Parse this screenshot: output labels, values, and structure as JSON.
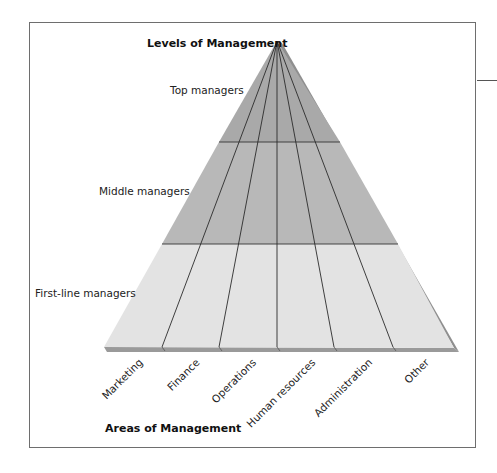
{
  "title": "Levels of Management",
  "axis_title": "Areas of Management",
  "levels": [
    {
      "label": "Top managers",
      "color": "#a9a9a9"
    },
    {
      "label": "Middle managers",
      "color": "#b9b9b9"
    },
    {
      "label": "First-line managers",
      "color": "#e4e4e4"
    }
  ],
  "areas": [
    {
      "label": "Marketing"
    },
    {
      "label": "Finance"
    },
    {
      "label": "Operations"
    },
    {
      "label": "Human resources"
    },
    {
      "label": "Administration"
    },
    {
      "label": "Other"
    }
  ],
  "colors": {
    "frame": "#6e6e6e",
    "divider": "#333333",
    "shadow": "#8f8f8f"
  }
}
